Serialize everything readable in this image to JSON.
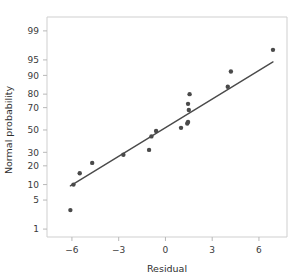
{
  "chart_data": {
    "type": "scatter",
    "title": "",
    "subtitle": "",
    "xlabel": "Residual",
    "ylabel": "Normal probability",
    "xlim": [
      -7.6,
      7.8
    ],
    "ylim": [
      0.6,
      99.6
    ],
    "grid": false,
    "legend": null,
    "x_ticks": [
      -6,
      -3,
      0,
      3,
      6
    ],
    "x_tick_labels": [
      "−6",
      "−3",
      "0",
      "3",
      "6"
    ],
    "y_ticks": [
      1,
      5,
      10,
      20,
      30,
      50,
      70,
      80,
      90,
      95,
      99
    ],
    "y_tick_labels": [
      "1",
      "5",
      "10",
      "20",
      "30",
      "50",
      "70",
      "80",
      "90",
      "95",
      "99"
    ],
    "y_scale": "probit",
    "marker_color": "#4a4a4a",
    "line_color": "#4a4a4a",
    "frame_color": "#cfcfcf",
    "background_color": "#ffffff",
    "x": [
      -6.1,
      -5.9,
      -5.5,
      -4.7,
      -2.7,
      -1.05,
      -0.9,
      -0.6,
      1.0,
      1.4,
      1.45,
      1.5,
      1.45,
      1.55,
      4.0,
      4.2,
      6.9
    ],
    "y": [
      3,
      10,
      15.5,
      22,
      28,
      32,
      44,
      49,
      52,
      56,
      57.5,
      68,
      73,
      80,
      84.5,
      91.5,
      97
    ],
    "points": [
      {
        "x": -6.1,
        "y": 3
      },
      {
        "x": -5.9,
        "y": 10
      },
      {
        "x": -5.5,
        "y": 15.5
      },
      {
        "x": -4.7,
        "y": 22
      },
      {
        "x": -2.7,
        "y": 28
      },
      {
        "x": -1.05,
        "y": 32
      },
      {
        "x": -0.9,
        "y": 44
      },
      {
        "x": -0.6,
        "y": 49
      },
      {
        "x": 1.0,
        "y": 52
      },
      {
        "x": 1.4,
        "y": 56
      },
      {
        "x": 1.45,
        "y": 57.5
      },
      {
        "x": 1.5,
        "y": 68
      },
      {
        "x": 1.45,
        "y": 73
      },
      {
        "x": 1.55,
        "y": 80
      },
      {
        "x": 4.0,
        "y": 84.5
      },
      {
        "x": 4.2,
        "y": 91.5
      },
      {
        "x": 6.9,
        "y": 97
      }
    ],
    "reference_line": {
      "x_start": -6.1,
      "y_start": 9.5,
      "x_end": 6.9,
      "y_end": 94.5
    }
  }
}
